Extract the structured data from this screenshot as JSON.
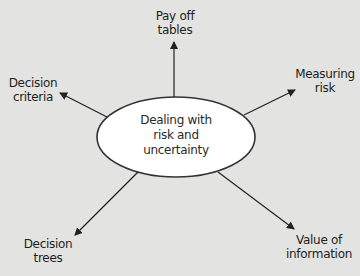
{
  "diagram": {
    "type": "mind-map",
    "background_color": "#e3e3e1",
    "line_color": "#222222",
    "center": {
      "lines": [
        "Dealing with",
        "risk and",
        "uncertainty"
      ],
      "shape": "ellipse",
      "fill": "#ffffff",
      "stroke": "#333333"
    },
    "branches": [
      {
        "id": "payoff-tables",
        "lines": [
          "Pay off",
          "tables"
        ],
        "direction": "up"
      },
      {
        "id": "measuring-risk",
        "lines": [
          "Measuring",
          "risk"
        ],
        "direction": "up-right"
      },
      {
        "id": "value-of-information",
        "lines": [
          "Value of",
          "information"
        ],
        "direction": "down-right"
      },
      {
        "id": "decision-trees",
        "lines": [
          "Decision",
          "trees"
        ],
        "direction": "down-left"
      },
      {
        "id": "decision-criteria",
        "lines": [
          "Decision",
          "criteria"
        ],
        "direction": "up-left"
      }
    ]
  }
}
